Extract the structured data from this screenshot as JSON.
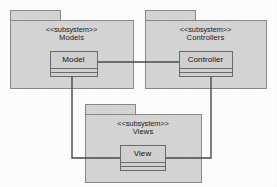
{
  "diagram": {
    "type": "uml-package-diagram",
    "colors": {
      "canvas_background": "#ffffff",
      "package_fill": "#d6d6d6",
      "package_stroke": "#8a8a8a",
      "class_fill": "#d2d2d2",
      "class_stroke": "#6b6b6b",
      "connector_stroke": "#4a4a4a",
      "text": "#1a1a1a"
    },
    "packages": [
      {
        "id": "models",
        "stereotype": "<<subsystem>>",
        "name": "Models",
        "tab": {
          "x": 10,
          "y": 10,
          "w": 50,
          "h": 10
        },
        "body": {
          "x": 10,
          "y": 20,
          "w": 123,
          "h": 68
        },
        "label": {
          "x": 10,
          "y": 26,
          "w": 123
        },
        "classifier": {
          "id": "model",
          "name": "Model",
          "box": {
            "x": 50,
            "y": 51,
            "w": 47,
            "h": 25
          },
          "dividers": [
            17,
            21
          ]
        }
      },
      {
        "id": "controllers",
        "stereotype": "<<subsystem>>",
        "name": "Controllers",
        "tab": {
          "x": 145,
          "y": 10,
          "w": 50,
          "h": 10
        },
        "body": {
          "x": 145,
          "y": 20,
          "w": 121,
          "h": 68
        },
        "label": {
          "x": 145,
          "y": 26,
          "w": 121
        },
        "classifier": {
          "id": "controller",
          "name": "Controller",
          "box": {
            "x": 179,
            "y": 51,
            "w": 53,
            "h": 25
          },
          "dividers": [
            17,
            21
          ]
        }
      },
      {
        "id": "views",
        "stereotype": "<<subsystem>>",
        "name": "Views",
        "tab": {
          "x": 85,
          "y": 104,
          "w": 50,
          "h": 10
        },
        "body": {
          "x": 85,
          "y": 114,
          "w": 116,
          "h": 68
        },
        "label": {
          "x": 85,
          "y": 120,
          "w": 116
        },
        "classifier": {
          "id": "view",
          "name": "View",
          "box": {
            "x": 120,
            "y": 145,
            "w": 45,
            "h": 25
          },
          "dividers": [
            17,
            21
          ]
        }
      }
    ],
    "connectors": [
      {
        "id": "model-controller",
        "from": "model",
        "to": "controller",
        "points": "97,62 179,62"
      },
      {
        "id": "model-view",
        "from": "model",
        "to": "view",
        "points": "72,76 72,158 120,158"
      },
      {
        "id": "controller-view",
        "from": "controller",
        "to": "view",
        "points": "211,76 211,158 165,158"
      }
    ]
  }
}
